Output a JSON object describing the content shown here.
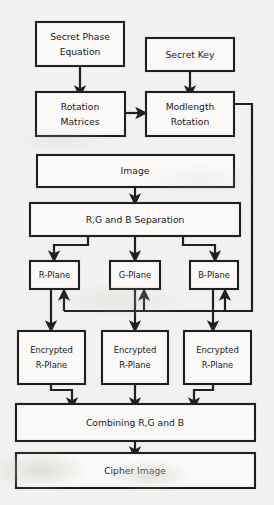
{
  "diagram": {
    "background_color": "#f2f1ef",
    "box_fill_color": "#fbfaf8",
    "line_color": "#22201f",
    "nodes": [
      {
        "id": "secret-phase-equation",
        "label_line1": "Secret Phase",
        "label_line2": "Equation"
      },
      {
        "id": "secret-key",
        "label_line1": "Secret Key",
        "label_line2": ""
      },
      {
        "id": "rotation-matrices",
        "label_line1": "Rotation",
        "label_line2": "Matrices"
      },
      {
        "id": "modlength-rotation",
        "label_line1": "Modlength",
        "label_line2": "Rotation"
      },
      {
        "id": "image",
        "label_line1": "Image",
        "label_line2": ""
      },
      {
        "id": "rgb-separation",
        "label_line1": "R,G and B Separation",
        "label_line2": ""
      },
      {
        "id": "r-plane",
        "label_line1": "R-Plane",
        "label_line2": ""
      },
      {
        "id": "g-plane",
        "label_line1": "G-Plane",
        "label_line2": ""
      },
      {
        "id": "b-plane",
        "label_line1": "B-Plane",
        "label_line2": ""
      },
      {
        "id": "encrypted-r-plane-1",
        "label_line1": "Encrypted",
        "label_line2": "R-Plane"
      },
      {
        "id": "encrypted-r-plane-2",
        "label_line1": "Encrypted",
        "label_line2": "R-Plane"
      },
      {
        "id": "encrypted-r-plane-3",
        "label_line1": "Encrypted",
        "label_line2": "R-Plane"
      },
      {
        "id": "combining-rgb",
        "label_line1": "Combining R,G and B",
        "label_line2": ""
      },
      {
        "id": "cipher-image",
        "label_line1": "Cipher Image",
        "label_line2": ""
      }
    ],
    "edges": [
      {
        "from": "secret-phase-equation",
        "to": "rotation-matrices"
      },
      {
        "from": "secret-key",
        "to": "modlength-rotation"
      },
      {
        "from": "rotation-matrices",
        "to": "modlength-rotation"
      },
      {
        "from": "image",
        "to": "rgb-separation"
      },
      {
        "from": "rgb-separation",
        "to": "r-plane"
      },
      {
        "from": "rgb-separation",
        "to": "g-plane"
      },
      {
        "from": "rgb-separation",
        "to": "b-plane"
      },
      {
        "from": "modlength-rotation",
        "to": "r-plane"
      },
      {
        "from": "modlength-rotation",
        "to": "g-plane"
      },
      {
        "from": "modlength-rotation",
        "to": "b-plane"
      },
      {
        "from": "r-plane",
        "to": "encrypted-r-plane-1"
      },
      {
        "from": "g-plane",
        "to": "encrypted-r-plane-2"
      },
      {
        "from": "b-plane",
        "to": "encrypted-r-plane-3"
      },
      {
        "from": "encrypted-r-plane-1",
        "to": "combining-rgb"
      },
      {
        "from": "encrypted-r-plane-2",
        "to": "combining-rgb"
      },
      {
        "from": "encrypted-r-plane-3",
        "to": "combining-rgb"
      },
      {
        "from": "combining-rgb",
        "to": "cipher-image"
      }
    ]
  }
}
